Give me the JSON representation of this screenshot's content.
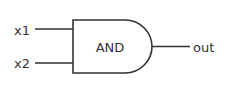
{
  "diagram": {
    "type": "logic-gate",
    "gate": {
      "kind": "AND",
      "label": "AND"
    },
    "inputs": [
      {
        "label": "x1"
      },
      {
        "label": "x2"
      }
    ],
    "output": {
      "label": "out"
    },
    "colors": {
      "stroke": "#333333",
      "text": "#333333",
      "background": "#ffffff"
    }
  }
}
